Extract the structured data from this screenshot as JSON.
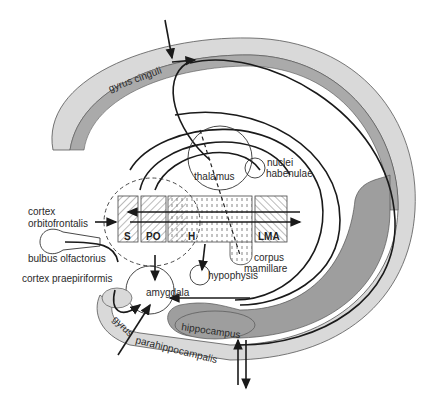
{
  "labels": {
    "gyrus_cinguli": "gyrus cinguli",
    "thalamus": "thalamus",
    "nuclei": "nuclei",
    "habenulae": "habenulae",
    "cortex": "cortex",
    "orbitofrontalis": "orbitofrontalis",
    "bulbus_olfactorius": "bulbus olfactorius",
    "cortex_praepiriformis": "cortex praepiriformis",
    "amygdala": "amygdala",
    "hypophysis": "hypophysis",
    "corpus": "corpus",
    "mamillare": "mamillare",
    "hippocampus": "hippocampus",
    "gyrus": "gyrus",
    "parahippocampalis": "parahippocampalis"
  },
  "boxes": [
    {
      "id": "S",
      "label": "S"
    },
    {
      "id": "PO",
      "label": "PO"
    },
    {
      "id": "H",
      "label": "H"
    },
    {
      "id": "LMA",
      "label": "LMA"
    }
  ],
  "colors": {
    "outer_band": "#d9d9d9",
    "inner_band": "#a8a8a8",
    "hippocampus": "#9e9e9e",
    "line": "#1a1a1a"
  }
}
